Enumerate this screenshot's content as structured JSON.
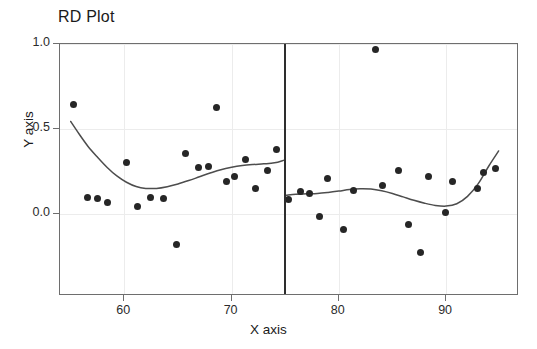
{
  "chart_data": {
    "type": "scatter",
    "title": "RD Plot",
    "xlabel": "X axis",
    "ylabel": "Y axis",
    "xlim": [
      54.0,
      96.8
    ],
    "ylim": [
      -0.48,
      1.0
    ],
    "xticks": [
      60,
      70,
      80,
      90
    ],
    "xtick_labels": [
      "60",
      "70",
      "80",
      "90"
    ],
    "yticks": [
      0.0,
      0.5,
      1.0
    ],
    "ytick_labels": [
      "0.0",
      "0.5",
      "1.0"
    ],
    "grid": true,
    "legend": "none",
    "cutoff": 75,
    "point_color": "#262626",
    "line_color": "#4d4d4d",
    "grid_color": "#ececec",
    "series": [
      {
        "name": "left-binned-means",
        "side": "left",
        "points": [
          [
            55.3,
            0.645
          ],
          [
            56.6,
            0.1
          ],
          [
            57.5,
            0.092
          ],
          [
            58.4,
            0.07
          ],
          [
            60.2,
            0.305
          ],
          [
            61.2,
            0.048
          ],
          [
            62.4,
            0.098
          ],
          [
            63.6,
            0.092
          ],
          [
            64.9,
            -0.18
          ],
          [
            65.7,
            0.355
          ],
          [
            66.9,
            0.275
          ],
          [
            67.8,
            0.282
          ],
          [
            68.6,
            0.625
          ],
          [
            69.5,
            0.192
          ],
          [
            70.3,
            0.225
          ],
          [
            71.3,
            0.32
          ],
          [
            72.2,
            0.15
          ],
          [
            73.3,
            0.255
          ],
          [
            74.2,
            0.378
          ]
        ]
      },
      {
        "name": "right-binned-means",
        "side": "right",
        "points": [
          [
            75.3,
            0.088
          ],
          [
            76.4,
            0.135
          ],
          [
            77.3,
            0.125
          ],
          [
            78.2,
            -0.012
          ],
          [
            78.9,
            0.212
          ],
          [
            80.4,
            -0.092
          ],
          [
            81.4,
            0.14
          ],
          [
            83.4,
            0.968
          ],
          [
            84.1,
            0.168
          ],
          [
            85.6,
            0.255
          ],
          [
            86.5,
            -0.062
          ],
          [
            87.6,
            -0.225
          ],
          [
            88.4,
            0.222
          ],
          [
            89.9,
            0.012
          ],
          [
            90.6,
            0.19
          ],
          [
            92.9,
            0.152
          ],
          [
            93.5,
            0.245
          ],
          [
            94.6,
            0.268
          ]
        ]
      }
    ],
    "fits": [
      {
        "name": "left-polynomial-fit",
        "side": "left",
        "x": [
          55.0,
          55.8,
          56.6,
          57.5,
          58.4,
          59.3,
          60.2,
          61.1,
          62.0,
          63.0,
          64.0,
          65.0,
          66.0,
          67.0,
          68.0,
          69.0,
          70.0,
          71.0,
          72.0,
          73.0,
          74.0,
          74.9
        ],
        "y": [
          0.545,
          0.47,
          0.4,
          0.335,
          0.275,
          0.225,
          0.188,
          0.163,
          0.152,
          0.152,
          0.162,
          0.178,
          0.198,
          0.22,
          0.242,
          0.262,
          0.276,
          0.286,
          0.292,
          0.296,
          0.302,
          0.318
        ]
      },
      {
        "name": "right-polynomial-fit",
        "side": "right",
        "x": [
          75.1,
          76.0,
          77.0,
          78.0,
          79.0,
          80.0,
          81.0,
          82.0,
          83.0,
          84.0,
          85.0,
          86.0,
          87.0,
          88.0,
          89.0,
          90.0,
          91.0,
          92.0,
          93.0,
          94.0,
          94.9
        ],
        "y": [
          0.112,
          0.118,
          0.12,
          0.122,
          0.128,
          0.136,
          0.145,
          0.15,
          0.148,
          0.138,
          0.122,
          0.102,
          0.082,
          0.065,
          0.052,
          0.048,
          0.062,
          0.105,
          0.18,
          0.285,
          0.372
        ]
      }
    ]
  }
}
